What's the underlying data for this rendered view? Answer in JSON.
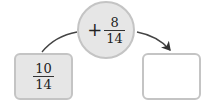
{
  "operation": {
    "operator": "+",
    "numerator": "8",
    "denominator": "14"
  },
  "start_value": {
    "numerator": "10",
    "denominator": "14"
  },
  "result_value": {
    "numerator": "",
    "denominator": ""
  },
  "colors": {
    "fill_gray": "#e6e6e6",
    "border_gray": "#c4c4c4",
    "arrow": "#333333"
  }
}
